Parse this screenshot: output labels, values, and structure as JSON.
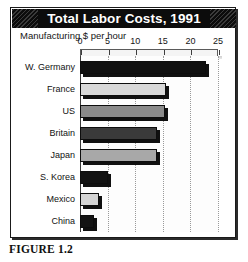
{
  "figure": {
    "title": "Total Labor Costs, 1991",
    "subtitle": "Manufacturing $ per hour",
    "caption": "FIGURE 1.2"
  },
  "chart_data": {
    "type": "bar",
    "orientation": "horizontal",
    "title": "Total Labor Costs, 1991",
    "subtitle": "Manufacturing $ per hour",
    "xlabel": "Manufacturing $ per hour",
    "ylabel": "",
    "xlim": [
      0,
      25
    ],
    "xticks": [
      0,
      5,
      10,
      15,
      20,
      25
    ],
    "tick_labels": [
      "0",
      "5",
      "10",
      "15",
      "20",
      "25"
    ],
    "grid": "vertical-dotted",
    "axis_position": "top",
    "legend": "none",
    "categories": [
      "W. Germany",
      "France",
      "US",
      "Britain",
      "Japan",
      "S. Korea",
      "Mexico",
      "China"
    ],
    "values": [
      22.8,
      15.6,
      15.4,
      14.0,
      14.0,
      5.0,
      3.5,
      2.5
    ],
    "bar_colors": [
      "#101010",
      "#d8d8d8",
      "#8a8a8a",
      "#3a3a3a",
      "#a8a8a8",
      "#121212",
      "#d4d4d4",
      "#141414"
    ]
  }
}
